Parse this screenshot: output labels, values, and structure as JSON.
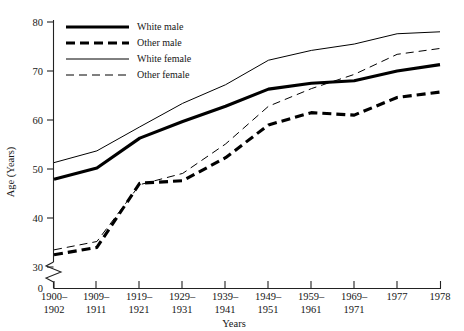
{
  "chart_data": {
    "type": "line",
    "title": "",
    "xlabel": "Years",
    "ylabel": "Age (Years)",
    "categories": [
      "1900–1902",
      "1909–1911",
      "1919–1921",
      "1929–1931",
      "1939–1941",
      "1949–1951",
      "1959–1961",
      "1969–1971",
      "1977",
      "1978"
    ],
    "ylim": [
      30,
      80
    ],
    "yticks": [
      30,
      40,
      50,
      60,
      70,
      80
    ],
    "ytick_labels": [
      "30",
      "40",
      "50",
      "60",
      "70",
      "80"
    ],
    "axis_break": true,
    "axis_break_label": "0",
    "grid": false,
    "legend_position": "top-left",
    "series": [
      {
        "name": "White male",
        "style": "thick-solid",
        "color": "#000000",
        "values": [
          47.9,
          50.2,
          56.3,
          59.7,
          62.8,
          66.3,
          67.5,
          68.0,
          70.0,
          71.3
        ]
      },
      {
        "name": "Other male",
        "style": "thick-dashed",
        "color": "#000000",
        "values": [
          32.5,
          34.0,
          47.1,
          47.6,
          52.3,
          59.0,
          61.5,
          61.0,
          64.6,
          65.7
        ]
      },
      {
        "name": "White female",
        "style": "thin-solid",
        "color": "#000000",
        "values": [
          51.3,
          53.7,
          58.6,
          63.4,
          67.2,
          72.2,
          74.2,
          75.5,
          77.6,
          78.0
        ]
      },
      {
        "name": "Other female",
        "style": "thin-dashed",
        "color": "#000000",
        "values": [
          33.5,
          35.2,
          46.8,
          49.1,
          55.1,
          62.8,
          66.4,
          69.3,
          73.4,
          74.6
        ]
      }
    ]
  },
  "legend": {
    "entries": [
      {
        "label": "White male"
      },
      {
        "label": "Other male"
      },
      {
        "label": "White female"
      },
      {
        "label": "Other female"
      }
    ]
  },
  "axes": {
    "y_title": "Age (Years)",
    "x_title": "Years",
    "y_labels": [
      "80",
      "70",
      "60",
      "50",
      "40",
      "30",
      "0"
    ],
    "x_labels_top": [
      "1900–",
      "1909–",
      "1919–",
      "1929–",
      "1939–",
      "1949–",
      "1959–",
      "1969–",
      "1977",
      "1978"
    ],
    "x_labels_bottom": [
      "1902",
      "1911",
      "1921",
      "1931",
      "1941",
      "1951",
      "1961",
      "1971",
      "",
      ""
    ]
  }
}
